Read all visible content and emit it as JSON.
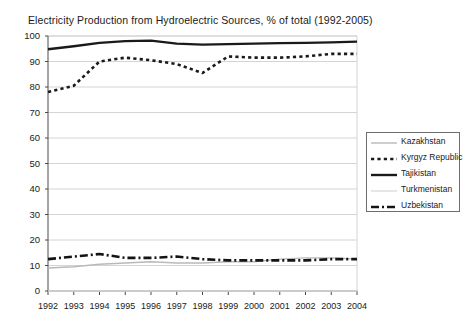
{
  "chart_data": {
    "type": "line",
    "title": "Electricity Production from Hydroelectric Sources, % of total (1992-2005)",
    "xlabel": "",
    "ylabel": "",
    "ylim": [
      0,
      100
    ],
    "ytick_step": 10,
    "yticks": [
      "0",
      "10",
      "20",
      "30",
      "40",
      "50",
      "60",
      "70",
      "80",
      "90",
      "100"
    ],
    "categories": [
      "1992",
      "1993",
      "1994",
      "1995",
      "1996",
      "1997",
      "1998",
      "1999",
      "2000",
      "2001",
      "2002",
      "2003",
      "2004"
    ],
    "grid": true,
    "legend_position": "right",
    "series": [
      {
        "name": "Kazakhstan",
        "color": "#b9b9b9",
        "style": "solid-thin",
        "values": [
          9.0,
          9.5,
          10.5,
          11.0,
          11.5,
          11.0,
          11.0,
          11.5,
          11.5,
          12.5,
          13.0,
          13.0,
          12.5
        ]
      },
      {
        "name": "Kyrgyz Republic",
        "color": "#1a1a1a",
        "style": "dotted",
        "values": [
          78.0,
          80.5,
          90.0,
          91.5,
          90.5,
          89.0,
          85.5,
          92.0,
          91.5,
          91.5,
          92.0,
          93.0,
          93.0
        ]
      },
      {
        "name": "Tajikistan",
        "color": "#1a1a1a",
        "style": "solid-thick",
        "values": [
          94.8,
          96.0,
          97.3,
          98.0,
          98.2,
          97.0,
          96.6,
          96.8,
          97.0,
          97.2,
          97.3,
          97.5,
          97.8
        ]
      },
      {
        "name": "Turkmenistan",
        "color": "#dcdcdc",
        "style": "solid-thin",
        "values": [
          0.0,
          0.0,
          0.0,
          0.0,
          0.0,
          0.0,
          0.0,
          0.0,
          0.0,
          0.0,
          0.0,
          0.0,
          0.0
        ]
      },
      {
        "name": "Uzbekistan",
        "color": "#141414",
        "style": "dash-dot-thick",
        "values": [
          12.5,
          13.5,
          14.5,
          13.0,
          13.0,
          13.5,
          12.5,
          12.0,
          12.0,
          12.0,
          12.0,
          12.5,
          12.5
        ]
      }
    ]
  },
  "legend": {
    "entries": [
      {
        "label": "Kazakhstan"
      },
      {
        "label": "Kyrgyz Republic"
      },
      {
        "label": "Tajikistan"
      },
      {
        "label": "Turkmenistan"
      },
      {
        "label": "Uzbekistan"
      }
    ]
  }
}
